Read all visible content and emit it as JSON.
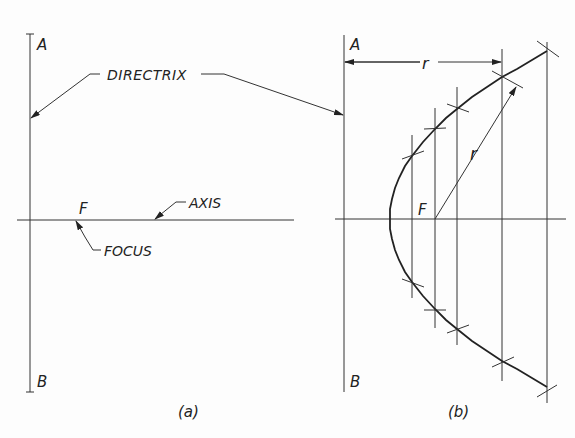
{
  "figure": {
    "panel_a": {
      "point_top": "A",
      "point_bottom": "B",
      "directrix_label": "DIRECTRIX",
      "focus_letter": "F",
      "focus_label": "FOCUS",
      "axis_label": "AXIS",
      "caption": "(a)"
    },
    "panel_b": {
      "point_top": "A",
      "point_bottom": "B",
      "dimension_label": "r",
      "radius_label": "r",
      "focus_letter": "F",
      "caption": "(b)",
      "construction_lines_x": [
        412,
        435,
        457,
        502,
        547
      ]
    },
    "colors": {
      "background": "#fdfdfd",
      "ink": "#222222"
    }
  }
}
